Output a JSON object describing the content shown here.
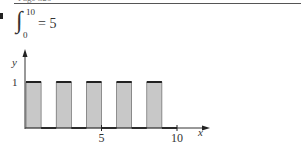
{
  "header": {
    "text": "Page 326"
  },
  "equation": {
    "upper_limit": "10",
    "lower_limit": "0",
    "rest": "= 5"
  },
  "chart_data": {
    "type": "bar",
    "title": "",
    "xlabel": "x",
    "ylabel": "y",
    "xlim": [
      0,
      10
    ],
    "ylim": [
      0,
      1
    ],
    "x_ticks": [
      {
        "value": 5,
        "label": "5"
      },
      {
        "value": 10,
        "label": "10"
      }
    ],
    "y_ticks": [
      {
        "value": 1,
        "label": "1"
      }
    ],
    "bars": [
      {
        "x_start": 0,
        "x_end": 1,
        "height": 1
      },
      {
        "x_start": 2,
        "x_end": 3,
        "height": 1
      },
      {
        "x_start": 4,
        "x_end": 5,
        "height": 1
      },
      {
        "x_start": 6,
        "x_end": 7,
        "height": 1
      },
      {
        "x_start": 8,
        "x_end": 9,
        "height": 1
      }
    ],
    "integral_value": 5,
    "fill_color": "#c8c8c8",
    "stroke_color": "#222222",
    "grid": false,
    "legend": null
  }
}
